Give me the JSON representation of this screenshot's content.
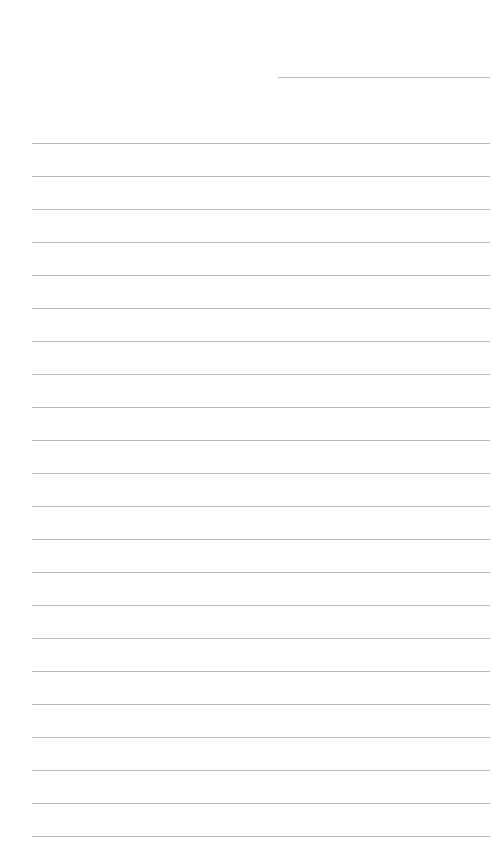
{
  "page": {
    "type": "ruled-paper",
    "background_color": "#ffffff",
    "line_color": "#b9b9b9",
    "header_line": {
      "x1": 278,
      "x2": 490,
      "y": 77
    },
    "rules": {
      "x1": 32,
      "x2": 490,
      "first_y": 143,
      "spacing": 33,
      "count": 22
    }
  }
}
